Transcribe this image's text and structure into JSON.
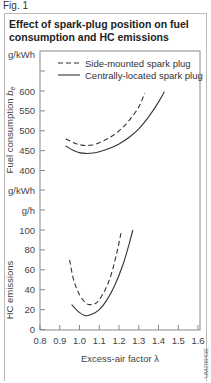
{
  "figure_label": "Fig. 1",
  "title": "Effect of spark-plug position on fuel consumption and HC emissions",
  "image_code": "UMZ0043E",
  "chart_data": {
    "type": "line",
    "title": "Effect of spark-plug position on fuel consumption and HC emissions",
    "xlabel": "Excess-air factor λ",
    "xlim": [
      0.8,
      1.6
    ],
    "x_ticks": [
      "0.8",
      "0.9",
      "1.0",
      "1.1",
      "1.2",
      "1.3",
      "1.4",
      "1.5",
      "1.6"
    ],
    "legend": {
      "position": "top-right inside plot",
      "entries": [
        {
          "label": "Side-mounted spark plug",
          "style": "dashed"
        },
        {
          "label": "Centrally-located spark plug",
          "style": "solid"
        }
      ]
    },
    "grid": false,
    "panels": [
      {
        "name": "fuel_consumption",
        "ylabel": "Fuel consumption b_e",
        "unit": "g/kWh",
        "ylim": [
          400,
          650
        ],
        "y_ticks": [
          "400",
          "450",
          "500",
          "550",
          "600"
        ],
        "series": [
          {
            "name": "Side-mounted spark plug",
            "style": "dashed",
            "x": [
              0.93,
              0.97,
              1.0,
              1.03,
              1.07,
              1.1,
              1.15,
              1.2,
              1.25,
              1.3,
              1.33
            ],
            "y": [
              480,
              470,
              465,
              463,
              465,
              470,
              482,
              500,
              525,
              560,
              595
            ]
          },
          {
            "name": "Centrally-located spark plug",
            "style": "solid",
            "x": [
              0.93,
              0.97,
              1.0,
              1.03,
              1.07,
              1.1,
              1.15,
              1.2,
              1.25,
              1.3,
              1.35,
              1.4,
              1.43
            ],
            "y": [
              462,
              450,
              445,
              443,
              444,
              447,
              455,
              467,
              483,
              505,
              535,
              572,
              598
            ]
          }
        ]
      },
      {
        "name": "hc_emissions",
        "ylabel": "HC emissions",
        "unit": "g/h",
        "ylim": [
          0,
          100
        ],
        "y_ticks": [
          "0",
          "20",
          "40",
          "60",
          "80",
          "100"
        ],
        "series": [
          {
            "name": "Side-mounted spark plug",
            "style": "dashed",
            "x": [
              0.95,
              0.97,
              1.0,
              1.03,
              1.05,
              1.08,
              1.1,
              1.13,
              1.16,
              1.19,
              1.21
            ],
            "y": [
              70,
              50,
              35,
              27,
              25,
              26,
              30,
              40,
              55,
              78,
              97
            ]
          },
          {
            "name": "Centrally-located spark plug",
            "style": "solid",
            "x": [
              0.96,
              1.0,
              1.03,
              1.06,
              1.1,
              1.14,
              1.18,
              1.22,
              1.25,
              1.27
            ],
            "y": [
              25,
              17,
              14,
              15,
              20,
              30,
              45,
              65,
              85,
              100
            ]
          }
        ]
      }
    ],
    "y_axis_units_labels": [
      "g/kWh",
      "g/kWh",
      "g/h"
    ]
  }
}
